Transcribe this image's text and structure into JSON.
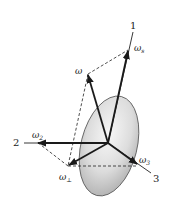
{
  "diagram": {
    "type": "rigid-body angular velocity decomposition",
    "axes": [
      {
        "id": "axis-1",
        "label": "1"
      },
      {
        "id": "axis-2",
        "label": "2"
      },
      {
        "id": "axis-3",
        "label": "3"
      }
    ],
    "vectors": [
      {
        "id": "omega",
        "label": "ω",
        "sub": ""
      },
      {
        "id": "omega-s",
        "label": "ω",
        "sub": "s"
      },
      {
        "id": "omega-2",
        "label": "ω",
        "sub": "2"
      },
      {
        "id": "omega-3",
        "label": "ω",
        "sub": "3"
      },
      {
        "id": "omega-perp",
        "label": "ω",
        "sub": "⊥"
      }
    ],
    "colors": {
      "line": "#1a1a1a",
      "ellipse_light": "#f2f2f2",
      "ellipse_dark": "#b8b8b8"
    }
  }
}
